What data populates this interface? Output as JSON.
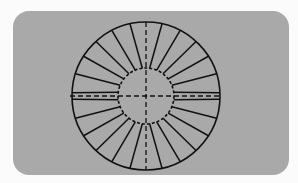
{
  "diagram": {
    "title": "",
    "colors": {
      "page": "#fbfbfb",
      "panel": "#a9a9a9",
      "stroke": "#111111"
    },
    "panel": {
      "x": 13,
      "y": 11,
      "width": 276,
      "height": 164,
      "radius": 16
    },
    "center": {
      "x": 146,
      "y": 96
    },
    "outer_radius": 74,
    "inner_radius": 28,
    "spoke_count": 24,
    "spoke_twist_deg": 5,
    "centerlines": {
      "style": "dashed",
      "horizontal": true,
      "vertical": true
    }
  }
}
